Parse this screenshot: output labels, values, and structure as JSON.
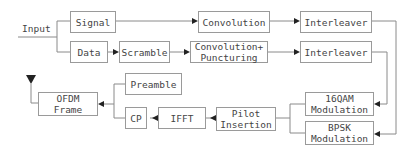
{
  "diagram": {
    "input_label": "Input",
    "blocks": {
      "signal": "Signal",
      "data": "Data",
      "scramble": "Scramble",
      "convolution": "Convolution",
      "conv_punct_line1": "Convolution+",
      "conv_punct_line2": "Puncturing",
      "interleaver_top": "Interleaver",
      "interleaver_bottom": "Interleaver",
      "qam_line1": "16QAM",
      "qam_line2": "Modulation",
      "bpsk_line1": "BPSK",
      "bpsk_line2": "Modulation",
      "pilot_line1": "Pilot",
      "pilot_line2": "Insertion",
      "ifft": "IFFT",
      "cp": "CP",
      "preamble": "Preamble",
      "ofdm_line1": "OFDM",
      "ofdm_line2": "Frame"
    },
    "colors": {
      "line": "#8a8a8a",
      "arrow": "#222222",
      "box_border": "#9a9a9a",
      "text": "#444444"
    }
  }
}
